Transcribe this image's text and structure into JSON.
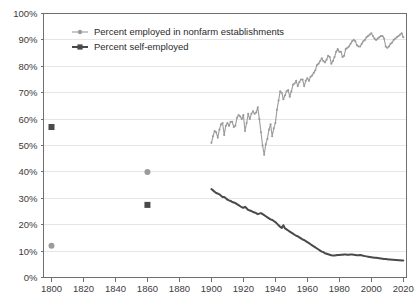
{
  "chart_data": {
    "type": "line",
    "title": "",
    "subtitle": "",
    "xlabel": "",
    "ylabel": "",
    "xlim": [
      1795,
      2022
    ],
    "ylim": [
      0,
      100
    ],
    "grid": true,
    "legend_position": "top-left-inside",
    "y_ticks": [
      "0%",
      "10%",
      "20%",
      "30%",
      "40%",
      "50%",
      "60%",
      "70%",
      "80%",
      "90%",
      "100%"
    ],
    "y_tick_values": [
      0,
      10,
      20,
      30,
      40,
      50,
      60,
      70,
      80,
      90,
      100
    ],
    "x_ticks": [
      "1800",
      "1820",
      "1840",
      "1860",
      "1880",
      "1900",
      "1920",
      "1940",
      "1960",
      "1980",
      "2000",
      "2020"
    ],
    "x_tick_values": [
      1800,
      1820,
      1840,
      1860,
      1880,
      1900,
      1920,
      1940,
      1960,
      1980,
      2000,
      2020
    ],
    "colors": {
      "nonfarm": "#9b9b9b",
      "self_employed": "#4a4a4a",
      "grid": "#e6e6e6",
      "axis": "#6f6f6f",
      "text": "#3b3b3b"
    },
    "series": [
      {
        "name": "Percent employed in nonfarm establishments",
        "key": "nonfarm",
        "color": "#9b9b9b",
        "marker": "circle",
        "isolated_points": [
          {
            "x": 1800,
            "y": 12.0
          },
          {
            "x": 1860,
            "y": 40.0
          }
        ],
        "x": [
          1900,
          1901,
          1902,
          1903,
          1904,
          1905,
          1906,
          1907,
          1908,
          1909,
          1910,
          1911,
          1912,
          1913,
          1914,
          1915,
          1916,
          1917,
          1918,
          1919,
          1920,
          1921,
          1922,
          1923,
          1924,
          1925,
          1926,
          1927,
          1928,
          1929,
          1930,
          1931,
          1932,
          1933,
          1934,
          1935,
          1936,
          1937,
          1938,
          1939,
          1940,
          1941,
          1942,
          1943,
          1944,
          1945,
          1946,
          1947,
          1948,
          1949,
          1950,
          1951,
          1952,
          1953,
          1954,
          1955,
          1956,
          1957,
          1958,
          1959,
          1960,
          1961,
          1962,
          1963,
          1964,
          1965,
          1966,
          1967,
          1968,
          1969,
          1970,
          1971,
          1972,
          1973,
          1974,
          1975,
          1976,
          1977,
          1978,
          1979,
          1980,
          1981,
          1982,
          1983,
          1984,
          1985,
          1986,
          1987,
          1988,
          1989,
          1990,
          1991,
          1992,
          1993,
          1994,
          1995,
          1996,
          1997,
          1998,
          1999,
          2000,
          2001,
          2002,
          2003,
          2004,
          2005,
          2006,
          2007,
          2008,
          2009,
          2010,
          2011,
          2012,
          2013,
          2014,
          2015,
          2016,
          2017,
          2018,
          2019,
          2020
        ],
        "y": [
          51.0,
          53.5,
          55.5,
          55.0,
          53.0,
          56.0,
          58.0,
          58.5,
          54.0,
          57.5,
          58.5,
          57.5,
          59.0,
          59.0,
          57.0,
          57.5,
          60.5,
          61.5,
          61.0,
          60.0,
          61.5,
          55.5,
          58.5,
          62.0,
          60.0,
          62.0,
          63.0,
          62.0,
          62.5,
          64.5,
          60.0,
          55.0,
          50.0,
          46.5,
          50.5,
          52.5,
          56.0,
          58.0,
          53.5,
          56.5,
          58.5,
          63.5,
          67.0,
          70.5,
          70.0,
          67.5,
          69.0,
          70.5,
          71.0,
          68.5,
          70.5,
          73.0,
          73.5,
          74.5,
          72.5,
          74.0,
          75.0,
          75.0,
          72.5,
          74.5,
          75.5,
          74.5,
          76.0,
          76.5,
          77.5,
          78.5,
          80.5,
          81.0,
          82.0,
          83.0,
          82.0,
          81.5,
          82.5,
          84.0,
          83.5,
          81.0,
          82.0,
          83.5,
          85.5,
          86.5,
          85.5,
          85.5,
          83.5,
          84.0,
          86.5,
          87.0,
          87.5,
          88.5,
          89.5,
          90.0,
          89.5,
          88.0,
          87.5,
          87.5,
          88.5,
          89.5,
          90.0,
          91.0,
          91.5,
          92.0,
          92.5,
          91.5,
          90.5,
          90.0,
          90.5,
          91.0,
          91.5,
          91.5,
          90.5,
          87.5,
          87.0,
          87.5,
          88.5,
          89.0,
          90.0,
          90.5,
          91.0,
          91.5,
          92.0,
          92.5,
          91.0
        ]
      },
      {
        "name": "Percent self-employed",
        "key": "self_employed",
        "color": "#4a4a4a",
        "marker": "square",
        "isolated_points": [
          {
            "x": 1800,
            "y": 57.0
          },
          {
            "x": 1860,
            "y": 27.5
          }
        ],
        "x": [
          1900,
          1901,
          1902,
          1903,
          1904,
          1905,
          1906,
          1907,
          1908,
          1909,
          1910,
          1911,
          1912,
          1913,
          1914,
          1915,
          1916,
          1917,
          1918,
          1919,
          1920,
          1921,
          1922,
          1923,
          1924,
          1925,
          1926,
          1927,
          1928,
          1929,
          1930,
          1931,
          1932,
          1933,
          1934,
          1935,
          1936,
          1937,
          1938,
          1939,
          1940,
          1941,
          1942,
          1943,
          1944,
          1945,
          1946,
          1947,
          1948,
          1949,
          1950,
          1951,
          1952,
          1953,
          1954,
          1955,
          1956,
          1957,
          1958,
          1959,
          1960,
          1961,
          1962,
          1963,
          1964,
          1965,
          1966,
          1967,
          1968,
          1969,
          1970,
          1971,
          1972,
          1973,
          1974,
          1975,
          1976,
          1977,
          1978,
          1979,
          1980,
          1981,
          1982,
          1983,
          1984,
          1985,
          1986,
          1987,
          1988,
          1989,
          1990,
          1991,
          1992,
          1993,
          1994,
          1995,
          1996,
          1997,
          1998,
          1999,
          2000,
          2001,
          2002,
          2003,
          2004,
          2005,
          2006,
          2007,
          2008,
          2009,
          2010,
          2011,
          2012,
          2013,
          2014,
          2015,
          2016,
          2017,
          2018,
          2019,
          2020
        ],
        "y": [
          33.5,
          33.0,
          32.5,
          32.0,
          31.8,
          31.5,
          31.0,
          30.5,
          30.5,
          30.0,
          29.5,
          29.2,
          29.0,
          28.6,
          28.4,
          28.2,
          27.8,
          27.4,
          27.0,
          26.6,
          26.4,
          26.8,
          26.2,
          25.6,
          25.4,
          25.2,
          24.8,
          24.6,
          24.4,
          24.0,
          24.2,
          24.4,
          24.0,
          23.6,
          23.2,
          22.8,
          22.4,
          22.0,
          21.8,
          21.4,
          21.0,
          20.4,
          19.8,
          19.2,
          18.8,
          19.8,
          18.6,
          18.2,
          17.8,
          17.4,
          17.0,
          16.6,
          16.2,
          15.8,
          15.6,
          15.2,
          14.8,
          14.4,
          14.2,
          13.8,
          13.4,
          13.0,
          12.6,
          12.2,
          11.8,
          11.4,
          11.0,
          10.6,
          10.2,
          9.8,
          9.6,
          9.2,
          9.0,
          8.8,
          8.6,
          8.4,
          8.3,
          8.3,
          8.4,
          8.5,
          8.5,
          8.6,
          8.6,
          8.7,
          8.7,
          8.6,
          8.6,
          8.7,
          8.7,
          8.6,
          8.5,
          8.4,
          8.4,
          8.5,
          8.4,
          8.2,
          8.1,
          8.0,
          7.9,
          7.8,
          7.7,
          7.6,
          7.5,
          7.5,
          7.4,
          7.3,
          7.2,
          7.1,
          7.0,
          7.0,
          6.9,
          6.8,
          6.8,
          6.7,
          6.7,
          6.6,
          6.6,
          6.5,
          6.5,
          6.4,
          6.4
        ]
      }
    ]
  },
  "legend": {
    "items": [
      {
        "label": "Percent employed in nonfarm establishments",
        "color": "#9b9b9b",
        "marker": "circle"
      },
      {
        "label": "Percent self-employed",
        "color": "#4a4a4a",
        "marker": "square"
      }
    ]
  }
}
